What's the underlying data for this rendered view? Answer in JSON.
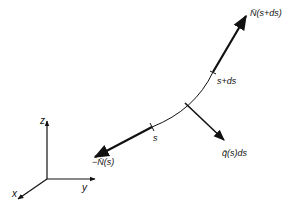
{
  "diagram": {
    "type": "force-on-curved-element",
    "labels": {
      "N_top": "N̄(s+ds)",
      "s_plus_ds": "s+ds",
      "s": "s",
      "N_bottom": "−N̄(s)",
      "q": "q̄(s)ds"
    },
    "axes": {
      "z": "z",
      "y": "y",
      "x": "x"
    },
    "colors": {
      "ink": "#111111",
      "background": "#ffffff"
    }
  }
}
